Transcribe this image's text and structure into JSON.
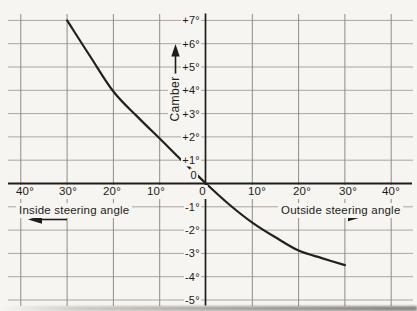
{
  "chart_data": {
    "type": "line",
    "grid": true,
    "y_axis": {
      "label": "Camber",
      "ticks": [
        "+7°",
        "+6°",
        "+5°",
        "+4°",
        "+3°",
        "+2°",
        "+1°",
        "0",
        "-1°",
        "-2°",
        "-3°",
        "-4°",
        "-5°"
      ],
      "range": [
        -5,
        7
      ]
    },
    "x_axis": {
      "left_label": "Inside steering angle",
      "right_label": "Outside steering angle",
      "left_ticks": [
        "40°",
        "30°",
        "20°",
        "10°"
      ],
      "zero_label": "0",
      "right_ticks": [
        "10°",
        "20°",
        "30°",
        "40°"
      ],
      "range": [
        -40,
        40
      ],
      "unit": "degrees"
    },
    "series": [
      {
        "name": "camber_curve",
        "points": [
          [
            -30,
            7.0
          ],
          [
            -25,
            5.45
          ],
          [
            -20,
            3.95
          ],
          [
            -15,
            2.9
          ],
          [
            -10,
            1.93
          ],
          [
            -5,
            0.95
          ],
          [
            0,
            0.0
          ],
          [
            5,
            -0.9
          ],
          [
            10,
            -1.68
          ],
          [
            15,
            -2.31
          ],
          [
            20,
            -2.88
          ],
          [
            25,
            -3.2
          ],
          [
            30,
            -3.5
          ]
        ]
      }
    ]
  },
  "colors": {
    "background": "#f7f5f1",
    "grid_horizontal": "#aaa69f",
    "grid_vertical": "#8e8c89",
    "axis": "#1e1d1b",
    "curve": "#23211f",
    "text": "#1b1a18"
  }
}
